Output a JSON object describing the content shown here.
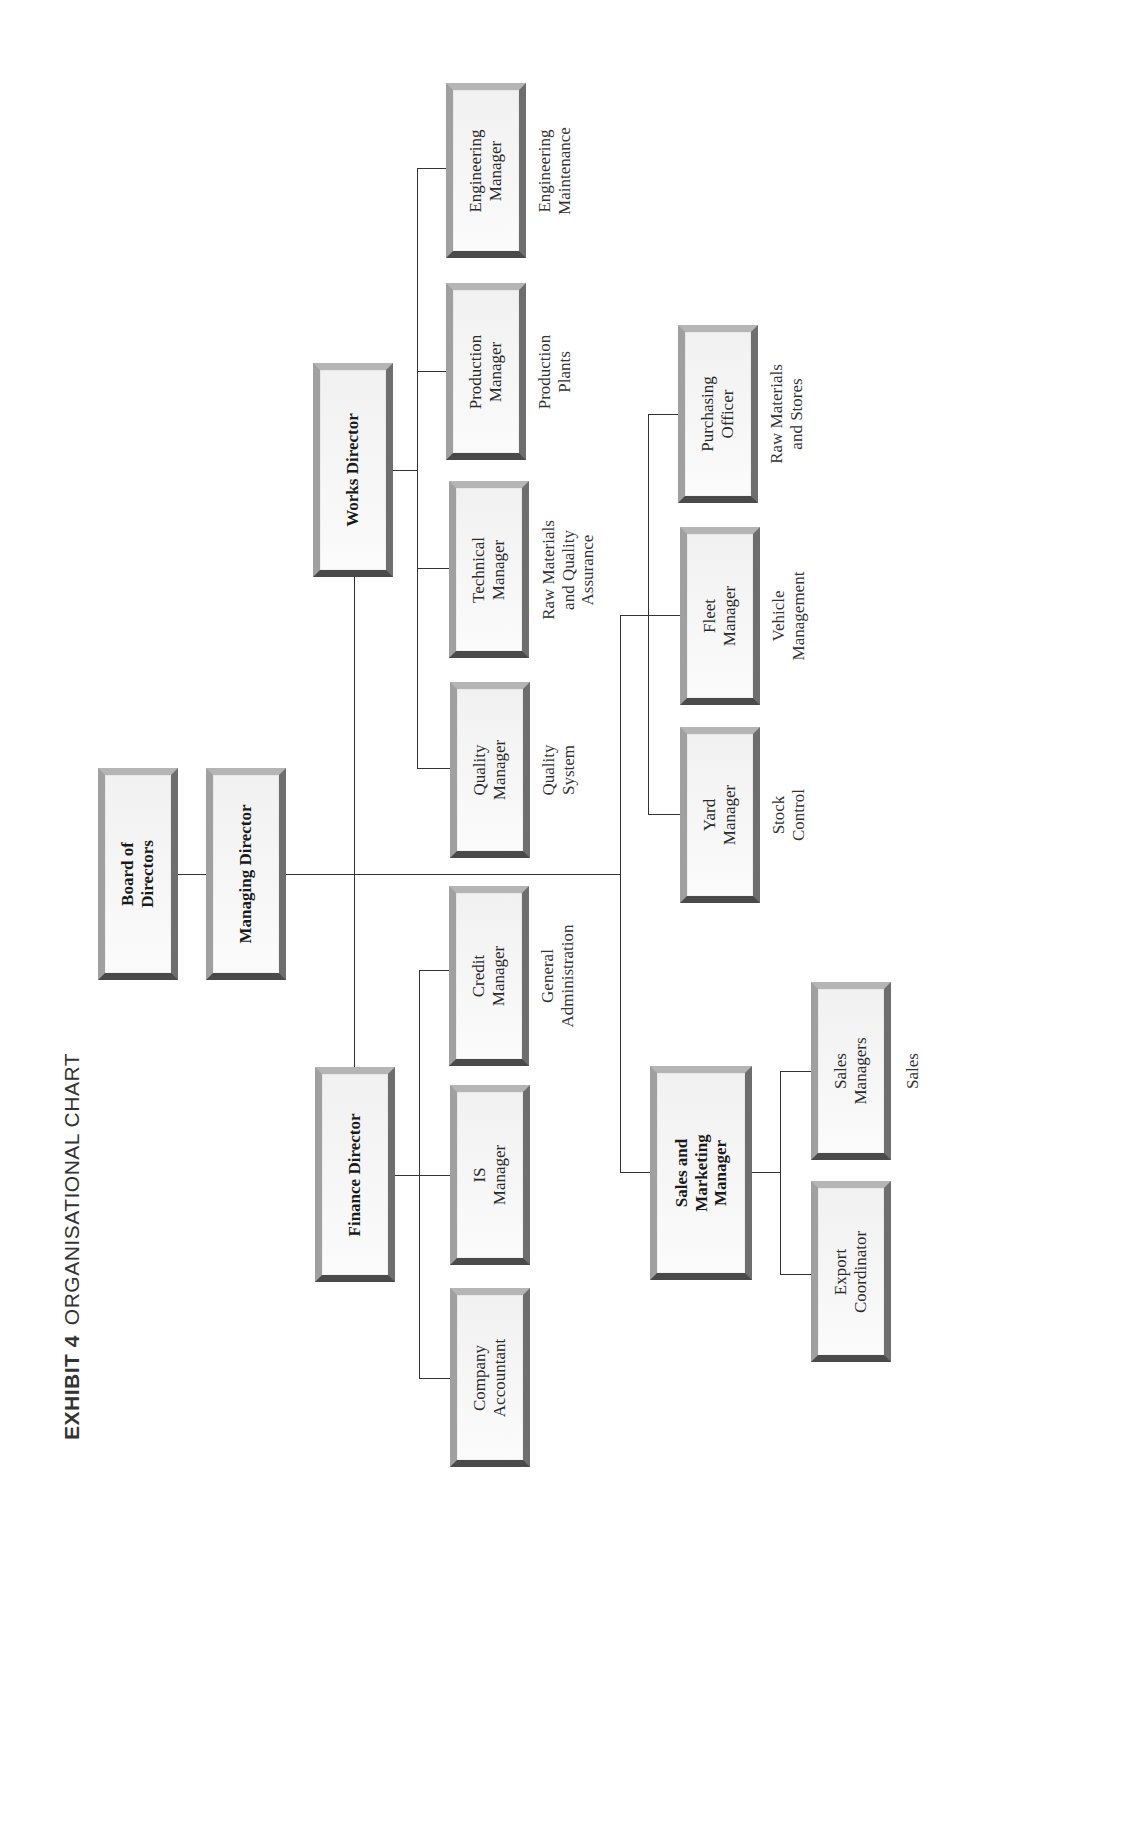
{
  "title": {
    "exhibit": "EXHIBIT 4",
    "name": "ORGANISATIONAL CHART"
  },
  "nodes": {
    "board": "Board of\nDirectors",
    "managing_director": "Managing Director",
    "works_director": "Works Director",
    "finance_director": "Finance Director",
    "sales_marketing": "Sales and\nMarketing\nManager",
    "engineering": "Engineering\nManager",
    "production": "Production\nManager",
    "technical": "Technical\nManager",
    "quality": "Quality\nManager",
    "credit": "Credit\nManager",
    "is": "IS\nManager",
    "company_accountant": "Company\nAccountant",
    "purchasing": "Purchasing\nOfficer",
    "fleet": "Fleet\nManager",
    "yard": "Yard\nManager",
    "sales_managers": "Sales\nManagers",
    "export": "Export\nCoordinator"
  },
  "responsibilities": {
    "engineering": "Engineering\nMaintenance",
    "production": "Production\nPlants",
    "technical": "Raw Materials\nand Quality\nAssurance",
    "quality": "Quality\nSystem",
    "credit": "General\nAdministration",
    "purchasing": "Raw Materials\nand Stores",
    "fleet": "Vehicle\nManagement",
    "yard": "Stock\nControl",
    "sales": "Sales"
  },
  "colors": {
    "line": "#333333",
    "box_border_light": "#b5b5b5",
    "box_border_dark": "#4a4a4a",
    "box_fill": "#f4f4f4"
  }
}
